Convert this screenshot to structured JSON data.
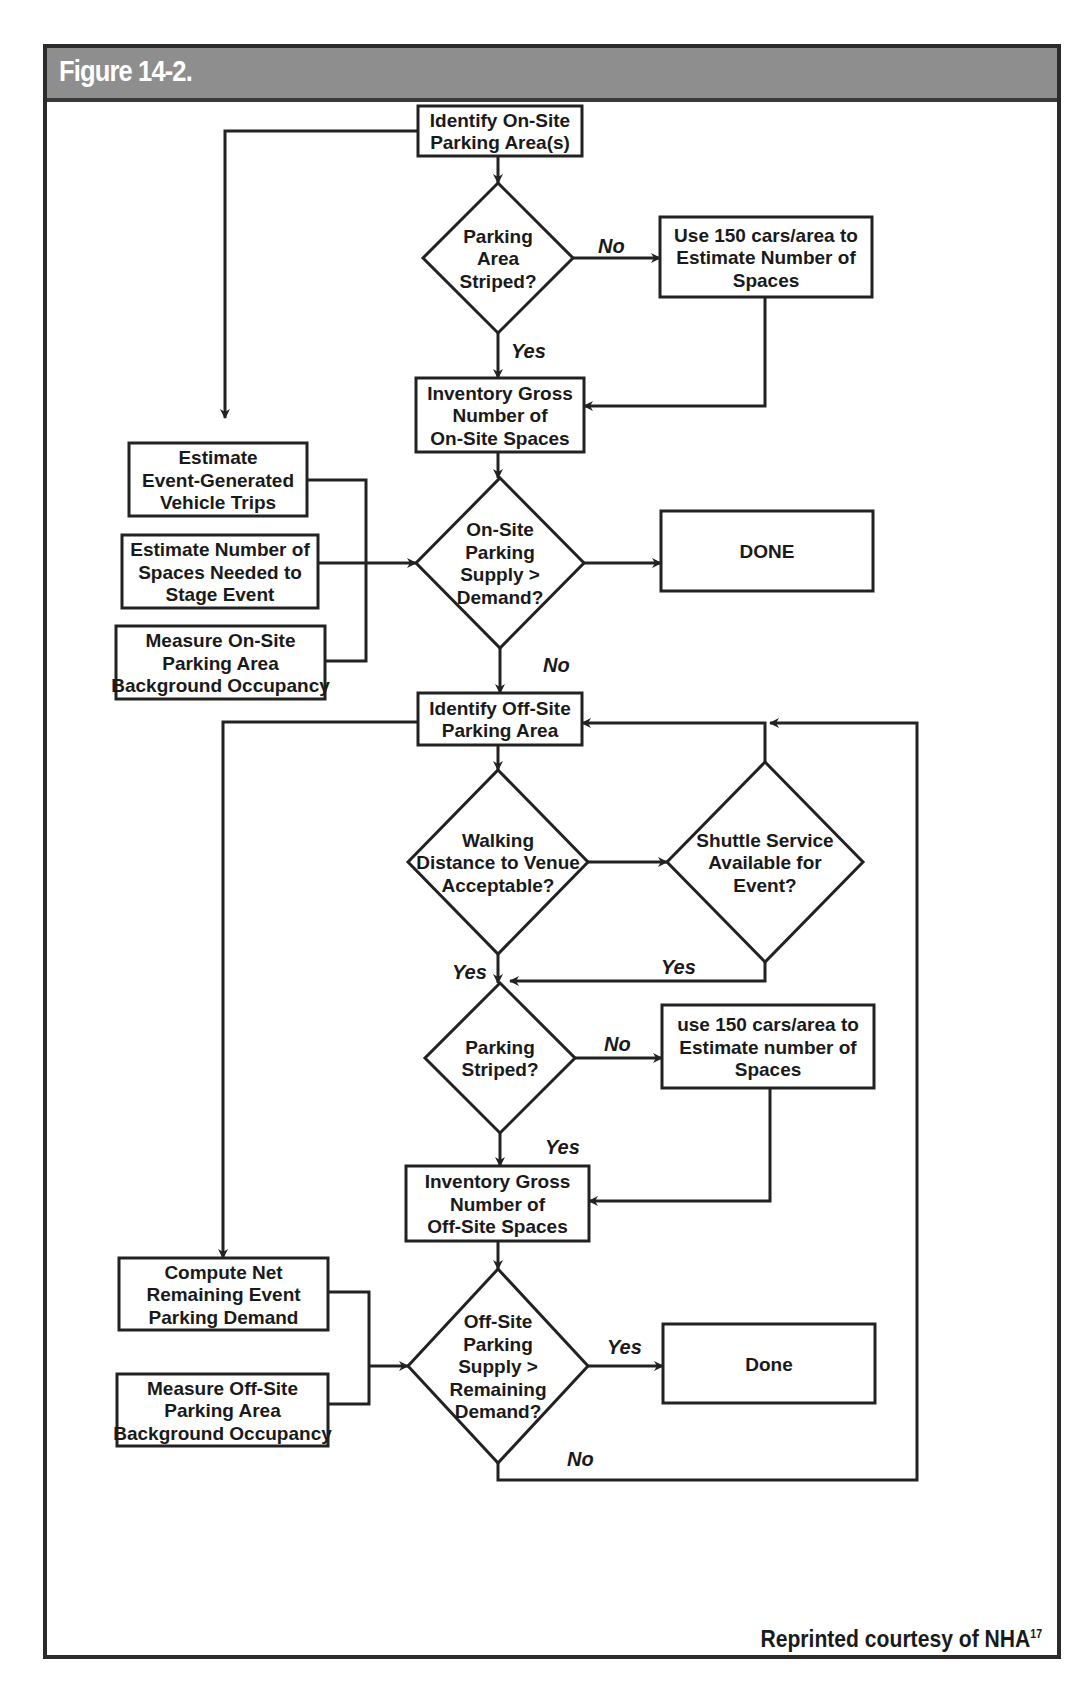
{
  "figure": {
    "title": "Figure 14-2.",
    "credit": "Reprinted courtesy of NHA",
    "credit_superscript": "17",
    "colors": {
      "header_bg": "#8e8e8e",
      "header_text": "#ffffff",
      "line": "#222222"
    }
  },
  "nodes": [
    {
      "id": "identify_onsite",
      "type": "box",
      "x": 418,
      "y": 106,
      "w": 164,
      "h": 50,
      "lines": [
        "Identify On-Site",
        "Parking Area(s)"
      ]
    },
    {
      "id": "striped1",
      "type": "diamond",
      "cx": 498,
      "cy": 258,
      "rw": 75,
      "rh": 75,
      "lines": [
        "Parking",
        "Area",
        "Striped?"
      ]
    },
    {
      "id": "use150_1",
      "type": "box",
      "x": 660,
      "y": 217,
      "w": 212,
      "h": 80,
      "lines": [
        "Use 150 cars/area to",
        "Estimate Number of",
        "Spaces"
      ]
    },
    {
      "id": "inv_onsite",
      "type": "box",
      "x": 416,
      "y": 378,
      "w": 168,
      "h": 74,
      "lines": [
        "Inventory Gross",
        "Number of",
        "On-Site Spaces"
      ]
    },
    {
      "id": "est_trips",
      "type": "box",
      "x": 129,
      "y": 443,
      "w": 178,
      "h": 73,
      "lines": [
        "Estimate",
        "Event-Generated",
        "Vehicle Trips"
      ]
    },
    {
      "id": "est_spaces",
      "type": "box",
      "x": 122,
      "y": 535,
      "w": 196,
      "h": 73,
      "lines": [
        "Estimate Number of",
        "Spaces Needed to",
        "Stage Event"
      ]
    },
    {
      "id": "measure_onsite",
      "type": "box",
      "x": 116,
      "y": 626,
      "w": 209,
      "h": 73,
      "lines": [
        "Measure On-Site",
        "Parking Area",
        "Background Occupancy"
      ]
    },
    {
      "id": "onsite_supply",
      "type": "diamond",
      "cx": 500,
      "cy": 563,
      "rw": 84,
      "rh": 85,
      "lines": [
        "On-Site",
        "Parking",
        "Supply >",
        "Demand?"
      ]
    },
    {
      "id": "done1",
      "type": "box",
      "x": 661,
      "y": 511,
      "w": 212,
      "h": 80,
      "lines": [
        "DONE"
      ]
    },
    {
      "id": "identify_offsite",
      "type": "box",
      "x": 418,
      "y": 693,
      "w": 164,
      "h": 52,
      "lines": [
        "Identify Off-Site",
        "Parking Area"
      ]
    },
    {
      "id": "walking",
      "type": "diamond",
      "cx": 498,
      "cy": 862,
      "rw": 90,
      "rh": 92,
      "lines": [
        "Walking",
        "Distance to Venue",
        "Acceptable?"
      ]
    },
    {
      "id": "shuttle",
      "type": "diamond",
      "cx": 765,
      "cy": 862,
      "rw": 98,
      "rh": 100,
      "lines": [
        "Shuttle Service",
        "Available for",
        "Event?"
      ]
    },
    {
      "id": "striped2",
      "type": "diamond",
      "cx": 500,
      "cy": 1058,
      "rw": 75,
      "rh": 75,
      "lines": [
        "Parking",
        "Striped?"
      ]
    },
    {
      "id": "use150_2",
      "type": "box",
      "x": 662,
      "y": 1005,
      "w": 212,
      "h": 83,
      "lines": [
        "use 150 cars/area to",
        "Estimate number of",
        "Spaces"
      ]
    },
    {
      "id": "inv_offsite",
      "type": "box",
      "x": 406,
      "y": 1166,
      "w": 183,
      "h": 75,
      "lines": [
        "Inventory Gross",
        "Number of",
        "Off-Site Spaces"
      ]
    },
    {
      "id": "compute_net",
      "type": "box",
      "x": 119,
      "y": 1258,
      "w": 209,
      "h": 72,
      "lines": [
        "Compute Net",
        "Remaining Event",
        "Parking Demand"
      ]
    },
    {
      "id": "measure_offsite",
      "type": "box",
      "x": 117,
      "y": 1374,
      "w": 211,
      "h": 72,
      "lines": [
        "Measure Off-Site",
        "Parking Area",
        "Background Occupancy"
      ]
    },
    {
      "id": "offsite_supply",
      "type": "diamond",
      "cx": 498,
      "cy": 1366,
      "rw": 90,
      "rh": 97,
      "lines": [
        "Off-Site",
        "Parking",
        "Supply >",
        "Remaining",
        "Demand?"
      ]
    },
    {
      "id": "done2",
      "type": "box",
      "x": 663,
      "y": 1324,
      "w": 212,
      "h": 79,
      "lines": [
        "Done"
      ]
    }
  ],
  "edges": [
    {
      "points": [
        [
          498,
          156
        ],
        [
          498,
          183
        ]
      ],
      "arrow": true
    },
    {
      "points": [
        [
          418,
          131
        ],
        [
          225,
          131
        ],
        [
          225,
          418
        ]
      ],
      "arrow": true
    },
    {
      "points": [
        [
          573,
          258
        ],
        [
          660,
          258
        ]
      ],
      "arrow": true
    },
    {
      "points": [
        [
          498,
          333
        ],
        [
          498,
          378
        ]
      ],
      "arrow": true
    },
    {
      "points": [
        [
          765,
          297
        ],
        [
          765,
          406
        ],
        [
          584,
          406
        ]
      ],
      "arrow": true
    },
    {
      "points": [
        [
          498,
          452
        ],
        [
          498,
          478
        ]
      ],
      "arrow": true
    },
    {
      "points": [
        [
          307,
          480
        ],
        [
          366,
          480
        ],
        [
          366,
          661
        ],
        [
          325,
          661
        ]
      ],
      "arrow": false
    },
    {
      "points": [
        [
          318,
          563
        ],
        [
          416,
          563
        ]
      ],
      "arrow": true
    },
    {
      "points": [
        [
          584,
          563
        ],
        [
          661,
          563
        ]
      ],
      "arrow": true
    },
    {
      "points": [
        [
          500,
          648
        ],
        [
          500,
          693
        ]
      ],
      "arrow": true
    },
    {
      "points": [
        [
          418,
          722
        ],
        [
          223,
          722
        ],
        [
          223,
          1258
        ]
      ],
      "arrow": true
    },
    {
      "points": [
        [
          498,
          745
        ],
        [
          498,
          770
        ]
      ],
      "arrow": true
    },
    {
      "points": [
        [
          588,
          862
        ],
        [
          667,
          862
        ]
      ],
      "arrow": true
    },
    {
      "points": [
        [
          765,
          762
        ],
        [
          765,
          723
        ],
        [
          582,
          723
        ]
      ],
      "arrow": true
    },
    {
      "points": [
        [
          498,
          954
        ],
        [
          498,
          983
        ]
      ],
      "arrow": true
    },
    {
      "points": [
        [
          765,
          962
        ],
        [
          765,
          981
        ],
        [
          510,
          981
        ]
      ],
      "arrow": true
    },
    {
      "points": [
        [
          575,
          1058
        ],
        [
          662,
          1058
        ]
      ],
      "arrow": true
    },
    {
      "points": [
        [
          500,
          1133
        ],
        [
          500,
          1166
        ]
      ],
      "arrow": true
    },
    {
      "points": [
        [
          770,
          1088
        ],
        [
          770,
          1201
        ],
        [
          589,
          1201
        ]
      ],
      "arrow": true
    },
    {
      "points": [
        [
          498,
          1241
        ],
        [
          498,
          1269
        ]
      ],
      "arrow": true
    },
    {
      "points": [
        [
          328,
          1292
        ],
        [
          369,
          1292
        ],
        [
          369,
          1404
        ],
        [
          328,
          1404
        ]
      ],
      "arrow": false
    },
    {
      "points": [
        [
          369,
          1366
        ],
        [
          408,
          1366
        ]
      ],
      "arrow": true
    },
    {
      "points": [
        [
          588,
          1366
        ],
        [
          663,
          1366
        ]
      ],
      "arrow": true
    },
    {
      "points": [
        [
          498,
          1463
        ],
        [
          498,
          1480
        ],
        [
          917,
          1480
        ],
        [
          917,
          723
        ],
        [
          770,
          723
        ]
      ],
      "arrow": true
    }
  ],
  "edge_labels": [
    {
      "text": "No",
      "x": 598,
      "y": 253
    },
    {
      "text": "Yes",
      "x": 511,
      "y": 358
    },
    {
      "text": "No",
      "x": 543,
      "y": 672
    },
    {
      "text": "Yes",
      "x": 452,
      "y": 979
    },
    {
      "text": "Yes",
      "x": 661,
      "y": 974
    },
    {
      "text": "No",
      "x": 604,
      "y": 1051
    },
    {
      "text": "Yes",
      "x": 545,
      "y": 1154
    },
    {
      "text": "Yes",
      "x": 607,
      "y": 1354
    },
    {
      "text": "No",
      "x": 567,
      "y": 1466
    }
  ]
}
